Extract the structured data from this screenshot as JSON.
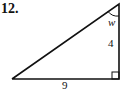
{
  "problem": {
    "number": "12.",
    "angle_label": "w",
    "vertical_side": "4",
    "horizontal_side": "9"
  },
  "figure": {
    "type": "right-triangle",
    "stroke_color": "#111111",
    "right_angle_at": "bottom-right"
  }
}
